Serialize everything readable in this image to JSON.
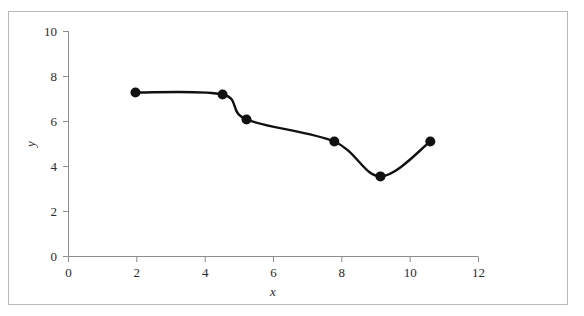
{
  "chart_data": {
    "type": "line",
    "title": "",
    "subtitle": "",
    "xlabel": "x",
    "ylabel": "y",
    "xlim": [
      0,
      12
    ],
    "ylim": [
      0,
      10
    ],
    "xticks": [
      0,
      2,
      4,
      6,
      8,
      10,
      12
    ],
    "yticks": [
      0,
      2,
      4,
      6,
      8,
      10
    ],
    "xtick_labels": [
      "0",
      "2",
      "4",
      "6",
      "8",
      "10",
      "12"
    ],
    "ytick_labels": [
      "0",
      "2",
      "4",
      "6",
      "8",
      "10"
    ],
    "grid": false,
    "legend": null,
    "series": [
      {
        "name": "series-1",
        "marker": "filled-circle",
        "marker_color": "#111111",
        "line_color": "#111111",
        "smoothing": "spline",
        "x": [
          1.96,
          4.51,
          5.21,
          7.78,
          9.13,
          10.59
        ],
        "y": [
          7.29,
          7.2,
          6.09,
          5.11,
          3.56,
          5.11
        ]
      }
    ],
    "annotations": []
  },
  "figure": {
    "border_color": "#b9b9b9",
    "background_color": "#ffffff",
    "axis_color": "#8d8d8d",
    "text_color": "#2b2b2b"
  }
}
